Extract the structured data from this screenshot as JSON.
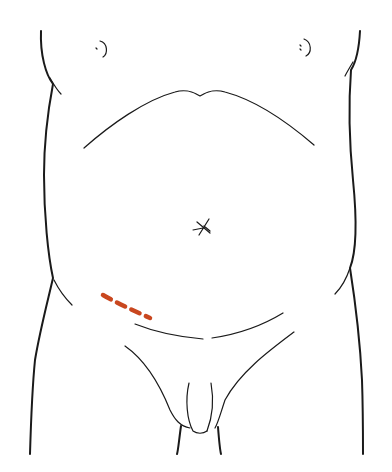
{
  "figure": {
    "alt_text": "Line drawing of a torso with dashed incision line in right lower quadrant",
    "incision": {
      "style": "dashed",
      "color": "#c9471f",
      "location": "right lower quadrant, oblique"
    },
    "stroke_color": "#1a1a1a",
    "background": "#ffffff"
  }
}
